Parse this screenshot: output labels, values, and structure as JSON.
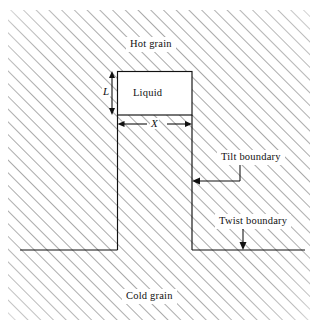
{
  "figure": {
    "type": "technical-schematic",
    "canvas": {
      "width": 318,
      "height": 328,
      "background": "#ffffff"
    },
    "colors": {
      "line": "#111111",
      "hatch": "#555555",
      "background": "#ffffff",
      "liquid_fill": "#ffffff"
    },
    "labels": {
      "hot_grain": "Hot grain",
      "cold_grain": "Cold grain",
      "liquid": "Liquid",
      "tilt_boundary": "Tilt boundary",
      "twist_boundary": "Twist boundary",
      "dimension_L": "L",
      "dimension_X": "X"
    },
    "regions": {
      "hot_grain": {
        "name": "hot-grain-region",
        "hatched": true,
        "description": "upper hatched solid region above the groove"
      },
      "cold_grain": {
        "name": "cold-grain-region",
        "hatched": true,
        "description": "lower hatched solid region below the groove"
      },
      "liquid_pocket": {
        "name": "liquid-pocket",
        "hatched": false,
        "x": 117,
        "y": 71,
        "width": 75,
        "height": 44
      }
    },
    "geometry": {
      "groove_left_wall_x": 117,
      "groove_right_wall_x": 192,
      "groove_bottom_y": 250,
      "liquid_top_y": 71,
      "liquid_bottom_y": 115,
      "bottom_line_left_start_x": 20,
      "bottom_line_right_end_x": 305,
      "hatch_angle_deg": 45,
      "hatch_spacing_px": 9
    },
    "annotations": [
      {
        "name": "tilt-boundary-leader",
        "label": "Tilt boundary",
        "points_to": "groove right wall",
        "arrow_direction": "left"
      },
      {
        "name": "twist-boundary-leader",
        "label": "Twist boundary",
        "points_to": "bottom horizontal boundary",
        "arrow_direction": "down"
      },
      {
        "name": "L-dimension",
        "label": "L",
        "measures": "liquid pocket depth",
        "arrow_direction": "vertical double-headed"
      },
      {
        "name": "X-dimension",
        "label": "X",
        "measures": "groove width",
        "arrow_direction": "horizontal double-headed"
      }
    ]
  }
}
